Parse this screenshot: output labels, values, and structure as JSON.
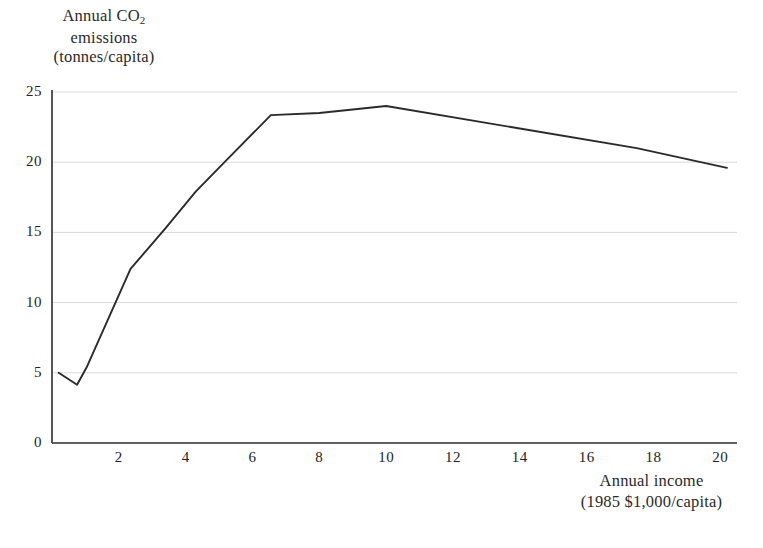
{
  "chart_data": {
    "type": "line",
    "title": "",
    "ylabel_lines": [
      "Annual CO₂",
      "emissions",
      "(tonnes/capita)"
    ],
    "xlabel_lines": [
      "Annual income",
      "(1985 $1,000/capita)"
    ],
    "xlabel": "Annual income (1985 $1,000/capita)",
    "ylabel": "Annual CO2 emissions (tonnes/capita)",
    "xlim": [
      0,
      20.5
    ],
    "ylim": [
      0,
      25
    ],
    "grid": "horizontal",
    "legend": "none",
    "xticks": [
      "2",
      "4",
      "6",
      "8",
      "10",
      "12",
      "14",
      "16",
      "18",
      "20"
    ],
    "xtick_values": [
      2,
      4,
      6,
      8,
      10,
      12,
      14,
      16,
      18,
      20
    ],
    "yticks": [
      "0",
      "5",
      "10",
      "15",
      "20",
      "25"
    ],
    "ytick_values": [
      0,
      5,
      10,
      15,
      20,
      25
    ],
    "series": [
      {
        "name": "CO2 emissions vs income",
        "color": "#2b2b2b",
        "x": [
          0.2,
          0.75,
          1.05,
          2.35,
          3.4,
          4.3,
          5.2,
          6.55,
          8.0,
          10.0,
          14.0,
          17.5,
          20.2
        ],
        "y": [
          5.0,
          4.15,
          5.45,
          12.4,
          15.3,
          17.9,
          20.1,
          23.35,
          23.5,
          24.0,
          22.4,
          21.0,
          19.6
        ]
      }
    ]
  },
  "axes": {
    "y_axis_name": "y-axis",
    "x_axis_name": "x-axis"
  }
}
